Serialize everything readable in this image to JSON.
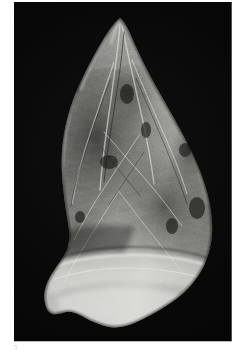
{
  "page": {
    "background_color": "#ffffff",
    "page_number": "5",
    "page_number_color": "#c4c4c4"
  },
  "plate": {
    "name": "artifact-photograph",
    "background_color": "#050505",
    "caption": "",
    "left_px": 14,
    "top_px": 2,
    "width_px": 218,
    "height_px": 339
  },
  "artifact": {
    "label": "bifacial stone point",
    "description": "Pointed teardrop-shaped flaked stone biface photographed against a black background",
    "material_tone_light": "#ededea",
    "material_tone_mid": "#9a9a96",
    "material_tone_dark": "#3a3a38",
    "orientation": "tip-up",
    "tip_point": "120,20",
    "widest_row": "y=235",
    "base_row": "y=322"
  }
}
